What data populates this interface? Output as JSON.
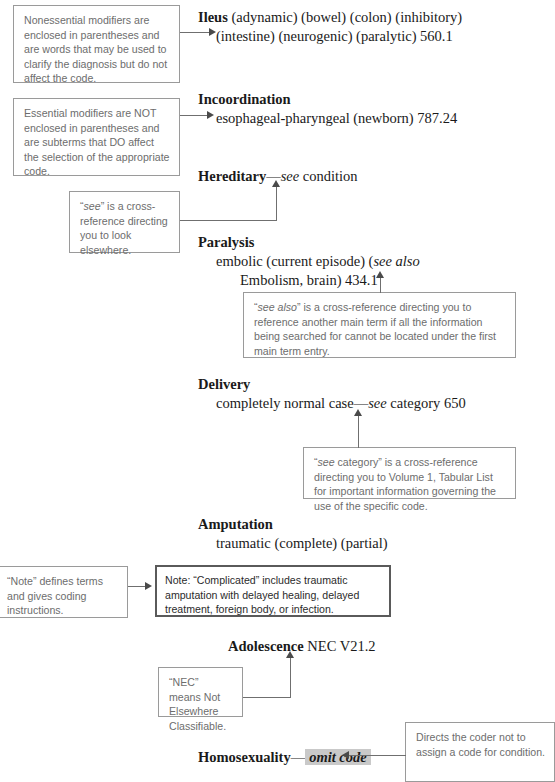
{
  "page": {
    "title": "ICD Alphabetic Index Conventions"
  },
  "entries": {
    "ileus": {
      "term": "Ileus",
      "line1": " (adynamic) (bowel) (colon) (inhibitory)",
      "line2": "(intestine) (neurogenic) (paralytic) 560.1"
    },
    "incoordination": {
      "term": "Incoordination",
      "sub": "esophageal-pharyngeal (newborn) 787.24"
    },
    "hereditary": {
      "term": "Hereditary",
      "dash": "—",
      "ital": "see",
      "rest": " condition"
    },
    "paralysis": {
      "term": "Paralysis",
      "sub1_pre": "embolic (current episode) (",
      "sub1_ital": "see also",
      "sub2": "Embolism, brain) 434.1"
    },
    "delivery": {
      "term": "Delivery",
      "sub_pre": "completely normal case",
      "sub_dash": "—",
      "sub_ital": "see",
      "sub_post": " category 650"
    },
    "amputation": {
      "term": "Amputation",
      "sub": "traumatic (complete) (partial)"
    },
    "adolescence": {
      "term": "Adolescence",
      "rest": " NEC V21.2"
    },
    "homosexuality": {
      "term": "Homosexuality",
      "dash": "—",
      "omit": "omit code"
    }
  },
  "note_box": {
    "text": "Note: “Complicated” includes traumatic amputation with delayed healing, delayed treatment, foreign body, or infection."
  },
  "callouts": {
    "nonessential": {
      "text": "Nonessential modifiers are enclosed in parentheses and are words that may be used to clarify the diagnosis but do not affect the code."
    },
    "essential": {
      "text": "Essential modifiers are NOT enclosed in parentheses and are subterms that DO affect the selection of the appropriate code."
    },
    "see": {
      "quote_open": "“",
      "ital": "see",
      "quote_close": "”",
      "rest": " is a cross-reference directing you to look elsewhere."
    },
    "see_also": {
      "quote_open": "“",
      "ital": "see also",
      "quote_close": "”",
      "rest": " is a cross-reference directing you to reference another main term if all the information being searched for cannot be located under the first main term entry."
    },
    "see_category": {
      "quote_open": "“",
      "ital": "see",
      "quote_mid": " category”",
      "rest": " is a cross-reference directing you to Volume 1, Tabular List for important information governing the use of the specific code."
    },
    "note_desc": {
      "quote_open": "“",
      "bold_word": "Note",
      "quote_close": "”",
      "rest": " defines terms and gives coding instructions."
    },
    "nec": {
      "text": "“NEC” means Not Elsewhere Classifiable."
    },
    "omit": {
      "text": "Directs the coder not to assign a code for condition."
    }
  },
  "colors": {
    "box_border": "#9a9a9a",
    "strong_border": "#5a5a5a",
    "callout_text": "#6d6d6d",
    "entry_text": "#1a1a1a",
    "connector": "#6f6f6f",
    "highlight": "#c9c9c9"
  }
}
